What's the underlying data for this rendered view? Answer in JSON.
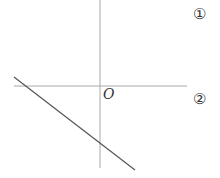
{
  "diagram": {
    "origin_label": "O",
    "markers": [
      "①",
      "②"
    ],
    "axes": {
      "x_axis": {
        "x1": 14,
        "y1": 86,
        "x2": 187,
        "y2": 86
      },
      "y_axis": {
        "x1": 100,
        "y1": 0,
        "x2": 100,
        "y2": 168
      }
    },
    "line": {
      "x1": 14,
      "y1": 77,
      "x2": 135,
      "y2": 170,
      "description": "straight line with negative slope and negative y-intercept"
    },
    "colors": {
      "axis": "#a8a8a8",
      "line": "#555555",
      "text": "#333333"
    }
  }
}
